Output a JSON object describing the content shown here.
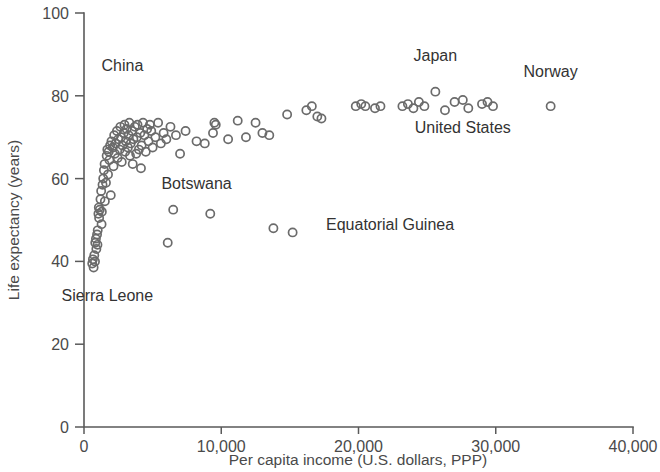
{
  "chart_data": {
    "type": "scatter",
    "title": "",
    "xlabel": "Per capita income (U.S. dollars, PPP)",
    "ylabel": "Life expectancy (years)",
    "xlim": [
      0,
      40000
    ],
    "ylim": [
      0,
      100
    ],
    "xticks": [
      0,
      10000,
      20000,
      30000,
      40000
    ],
    "xtick_labels": [
      "0",
      "10,000",
      "20,000",
      "30,000",
      "40,000"
    ],
    "yticks": [
      0,
      20,
      40,
      60,
      80,
      100
    ],
    "ytick_labels": [
      "0",
      "20",
      "40",
      "60",
      "80",
      "100"
    ],
    "grid": false,
    "legend": false,
    "marker": "open-circle",
    "marker_color": "#6b6b6b",
    "points": [
      [
        600,
        39.5
      ],
      [
        650,
        40.5
      ],
      [
        700,
        38.5
      ],
      [
        750,
        41.5
      ],
      [
        800,
        40.0
      ],
      [
        820,
        44.5
      ],
      [
        870,
        45.5
      ],
      [
        900,
        43.0
      ],
      [
        950,
        46.5
      ],
      [
        980,
        44.0
      ],
      [
        1000,
        47.5
      ],
      [
        1050,
        51.5
      ],
      [
        1080,
        53.0
      ],
      [
        1100,
        50.5
      ],
      [
        1150,
        52.5
      ],
      [
        1200,
        55.0
      ],
      [
        1250,
        57.0
      ],
      [
        1280,
        49.0
      ],
      [
        1300,
        52.0
      ],
      [
        1350,
        58.5
      ],
      [
        1400,
        60.0
      ],
      [
        1450,
        62.0
      ],
      [
        1500,
        63.5
      ],
      [
        1520,
        54.5
      ],
      [
        1600,
        59.0
      ],
      [
        1650,
        65.5
      ],
      [
        1700,
        67.0
      ],
      [
        1750,
        61.0
      ],
      [
        1800,
        66.5
      ],
      [
        1850,
        64.5
      ],
      [
        1900,
        68.0
      ],
      [
        1950,
        56.0
      ],
      [
        2000,
        69.0
      ],
      [
        2100,
        67.5
      ],
      [
        2150,
        63.0
      ],
      [
        2200,
        70.5
      ],
      [
        2250,
        66.0
      ],
      [
        2300,
        68.5
      ],
      [
        2400,
        71.5
      ],
      [
        2450,
        65.0
      ],
      [
        2500,
        69.5
      ],
      [
        2600,
        67.0
      ],
      [
        2650,
        72.5
      ],
      [
        2700,
        70.0
      ],
      [
        2750,
        64.0
      ],
      [
        2800,
        68.0
      ],
      [
        2900,
        71.0
      ],
      [
        2950,
        73.0
      ],
      [
        3000,
        66.5
      ],
      [
        3050,
        69.0
      ],
      [
        3100,
        72.0
      ],
      [
        3200,
        67.5
      ],
      [
        3250,
        70.5
      ],
      [
        3300,
        73.5
      ],
      [
        3350,
        65.5
      ],
      [
        3400,
        68.5
      ],
      [
        3500,
        71.5
      ],
      [
        3550,
        63.5
      ],
      [
        3600,
        69.5
      ],
      [
        3700,
        72.5
      ],
      [
        3800,
        66.0
      ],
      [
        3850,
        70.0
      ],
      [
        3900,
        73.0
      ],
      [
        4000,
        67.0
      ],
      [
        4100,
        71.0
      ],
      [
        4150,
        62.5
      ],
      [
        4200,
        68.0
      ],
      [
        4300,
        73.5
      ],
      [
        4400,
        70.5
      ],
      [
        4500,
        66.5
      ],
      [
        4600,
        72.0
      ],
      [
        4700,
        69.0
      ],
      [
        4800,
        73.0
      ],
      [
        4900,
        71.5
      ],
      [
        5000,
        67.5
      ],
      [
        5200,
        70.0
      ],
      [
        5400,
        73.5
      ],
      [
        5600,
        68.5
      ],
      [
        5800,
        71.0
      ],
      [
        6000,
        69.5
      ],
      [
        6100,
        44.5
      ],
      [
        6300,
        72.5
      ],
      [
        6500,
        52.5
      ],
      [
        6700,
        70.5
      ],
      [
        7000,
        66.0
      ],
      [
        7400,
        71.5
      ],
      [
        8200,
        69.0
      ],
      [
        8800,
        68.5
      ],
      [
        9200,
        51.5
      ],
      [
        9400,
        71.0
      ],
      [
        9500,
        73.5
      ],
      [
        9600,
        73.0
      ],
      [
        10500,
        69.5
      ],
      [
        11200,
        74.0
      ],
      [
        11800,
        70.0
      ],
      [
        12500,
        73.5
      ],
      [
        13000,
        71.0
      ],
      [
        13500,
        70.5
      ],
      [
        13800,
        48.0
      ],
      [
        14800,
        75.5
      ],
      [
        15200,
        47.0
      ],
      [
        16200,
        76.5
      ],
      [
        16600,
        77.5
      ],
      [
        17000,
        75.0
      ],
      [
        17300,
        74.5
      ],
      [
        19800,
        77.5
      ],
      [
        20200,
        78.0
      ],
      [
        20500,
        77.5
      ],
      [
        21200,
        77.0
      ],
      [
        21600,
        77.5
      ],
      [
        23200,
        77.5
      ],
      [
        23600,
        78.0
      ],
      [
        24000,
        77.0
      ],
      [
        24400,
        78.5
      ],
      [
        24800,
        77.5
      ],
      [
        25600,
        81.0
      ],
      [
        26300,
        76.5
      ],
      [
        27000,
        78.5
      ],
      [
        27600,
        79.0
      ],
      [
        28000,
        77.0
      ],
      [
        29000,
        78.0
      ],
      [
        29400,
        78.5
      ],
      [
        29800,
        77.5
      ],
      [
        34000,
        77.5
      ]
    ],
    "annotations": [
      {
        "label": "China",
        "x": 2800,
        "y": 86.0,
        "anchor": "middle"
      },
      {
        "label": "Sierra Leone",
        "x": 1700,
        "y": 30.5,
        "anchor": "middle"
      },
      {
        "label": "Botswana",
        "x": 8200,
        "y": 57.5,
        "anchor": "middle"
      },
      {
        "label": "Equatorial Guinea",
        "x": 22300,
        "y": 47.5,
        "anchor": "middle"
      },
      {
        "label": "Japan",
        "x": 25600,
        "y": 88.5,
        "anchor": "middle"
      },
      {
        "label": "Norway",
        "x": 34000,
        "y": 84.5,
        "anchor": "middle"
      },
      {
        "label": "United States",
        "x": 27600,
        "y": 71.0,
        "anchor": "middle"
      }
    ]
  }
}
